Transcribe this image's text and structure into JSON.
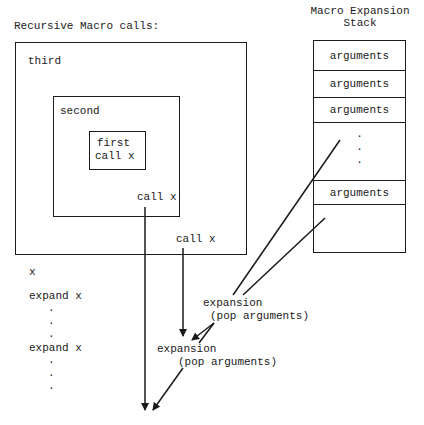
{
  "title": "Recursive Macro calls:",
  "boxes": {
    "third": "third",
    "second": "second",
    "first_line1": "first",
    "first_line2": "call x",
    "second_call": "call x",
    "third_call": "call x"
  },
  "stack": {
    "title_line1": "Macro Expansion",
    "title_line2": "Stack",
    "cells": [
      "arguments",
      "arguments",
      "arguments",
      ".",
      ".",
      ".",
      "arguments",
      ""
    ]
  },
  "listing": {
    "items": [
      "x",
      "expand x",
      ".",
      ".",
      ".",
      "expand x",
      ".",
      ".",
      "."
    ]
  },
  "expansions": [
    {
      "line1": "expansion",
      "line2": "(pop arguments)"
    },
    {
      "line1": "expansion",
      "line2": "(pop arguments)"
    }
  ]
}
